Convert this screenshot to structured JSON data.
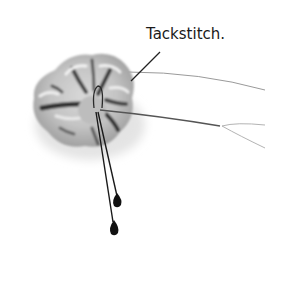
{
  "figure": {
    "annotation_label": "Tackstitch.",
    "colors": {
      "background": "#ffffff",
      "petal_light": "#e6e6e6",
      "petal_mid": "#b8b8b8",
      "petal_dark": "#3a3a3a",
      "wire": "#8c8c8c",
      "stamen": "#111111",
      "leader_line": "#222222"
    }
  }
}
